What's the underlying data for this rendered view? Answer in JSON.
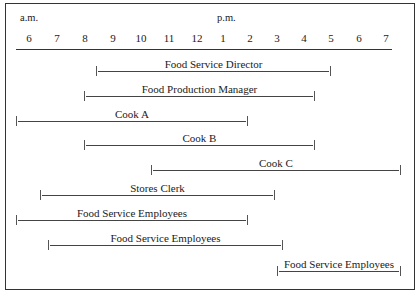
{
  "chart_data": {
    "type": "gantt",
    "title": "",
    "period_labels": [
      "a.m.",
      "p.m."
    ],
    "ticks": [
      "6",
      "7",
      "8",
      "9",
      "10",
      "11",
      "12",
      "1",
      "2",
      "3",
      "4",
      "5",
      "6",
      "7"
    ],
    "axis_start_hour": 6,
    "axis_end_hour": 19,
    "rows": [
      {
        "label": "Food Service Director",
        "start": 8.5,
        "end": 17.0
      },
      {
        "label": "Food Production Manager",
        "start": 8.0,
        "end": 16.5
      },
      {
        "label": "Cook A",
        "start": 5.5,
        "end": 14.0
      },
      {
        "label": "Cook B",
        "start": 8.0,
        "end": 16.5
      },
      {
        "label": "Cook C",
        "start": 10.5,
        "end": 19.5
      },
      {
        "label": "Stores Clerk",
        "start": 6.5,
        "end": 15.0
      },
      {
        "label": "Food Service Employees",
        "start": 5.5,
        "end": 14.0
      },
      {
        "label": "Food Service Employees",
        "start": 6.75,
        "end": 15.25
      },
      {
        "label": "Food Service Employees",
        "start": 15.0,
        "end": 19.5
      }
    ]
  },
  "header": {
    "am_label": "a.m.",
    "pm_label": "p.m."
  },
  "ticks": [
    {
      "label": "6",
      "x": 29
    },
    {
      "label": "7",
      "x": 57
    },
    {
      "label": "8",
      "x": 85
    },
    {
      "label": "9",
      "x": 113
    },
    {
      "label": "10",
      "x": 141
    },
    {
      "label": "11",
      "x": 169
    },
    {
      "label": "12",
      "x": 197
    },
    {
      "label": "1",
      "x": 223
    },
    {
      "label": "2",
      "x": 250
    },
    {
      "label": "3",
      "x": 277
    },
    {
      "label": "4",
      "x": 304
    },
    {
      "label": "5",
      "x": 331
    },
    {
      "label": "6",
      "x": 359
    },
    {
      "label": "7",
      "x": 386
    }
  ],
  "bars": [
    {
      "label": "Food Service Director",
      "x1": 96,
      "x2": 331,
      "y": 73
    },
    {
      "label": "Food Production Manager",
      "x1": 84,
      "x2": 315,
      "y": 98
    },
    {
      "label": "Cook A",
      "x1": 16,
      "x2": 248,
      "y": 123
    },
    {
      "label": "Cook B",
      "x1": 84,
      "x2": 315,
      "y": 147
    },
    {
      "label": "Cook C",
      "x1": 151,
      "x2": 401,
      "y": 172
    },
    {
      "label": "Stores Clerk",
      "x1": 40,
      "x2": 275,
      "y": 197
    },
    {
      "label": "Food Service Employees",
      "x1": 16,
      "x2": 248,
      "y": 222
    },
    {
      "label": "Food Service Employees",
      "x1": 48,
      "x2": 283,
      "y": 247
    },
    {
      "label": "Food Service Employees",
      "x1": 277,
      "x2": 401,
      "y": 273
    }
  ]
}
